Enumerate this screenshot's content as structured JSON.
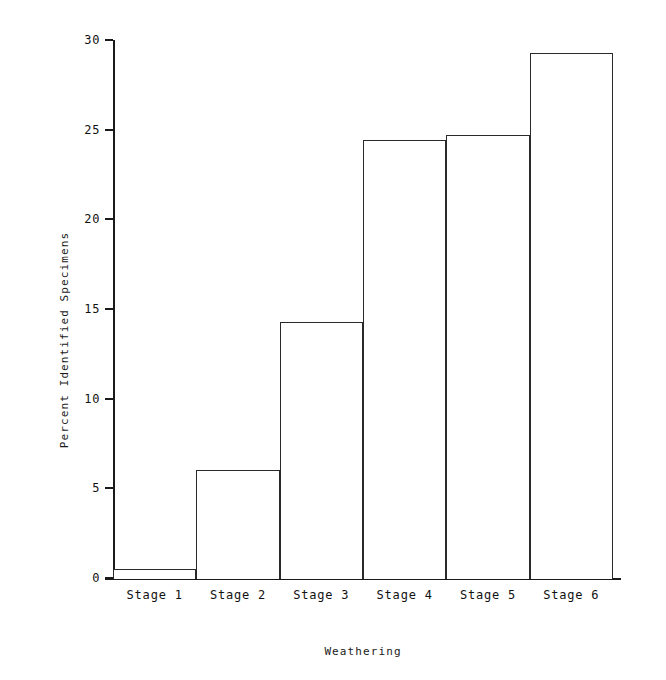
{
  "chart_data": {
    "type": "bar",
    "title": "",
    "subtitle": "",
    "xlabel": "Weathering",
    "ylabel": "Percent Identified Specimens",
    "categories": [
      "Stage 1",
      "Stage 2",
      "Stage 3",
      "Stage 4",
      "Stage 5",
      "Stage 6"
    ],
    "values": [
      0.5,
      6.0,
      14.3,
      24.4,
      24.7,
      29.3
    ],
    "series": [
      {
        "name": "Percent Identified Specimens",
        "values": [
          0.5,
          6.0,
          14.3,
          24.4,
          24.7,
          29.3
        ]
      }
    ],
    "ylim": [
      0,
      30
    ],
    "xlim_categories": 6,
    "ytick_labels": [
      "0",
      "5",
      "10",
      "15",
      "20",
      "25",
      "30"
    ],
    "ytick_values": [
      0,
      5,
      10,
      15,
      20,
      25,
      30
    ],
    "xtick_labels": [
      "Stage 1",
      "Stage 2",
      "Stage 3",
      "Stage 4",
      "Stage 5",
      "Stage 6"
    ],
    "grid": false,
    "legend": false,
    "legend_position": "none",
    "bar_style": "outlined",
    "bar_fill_color": "#ffffff",
    "bar_edge_color": "#2a2a2a",
    "background_color": "#ffffff",
    "axis_color": "#1a1a1a",
    "annotations": []
  },
  "axes": {
    "y_title": "Percent Identified Specimens",
    "x_title": "Weathering"
  }
}
